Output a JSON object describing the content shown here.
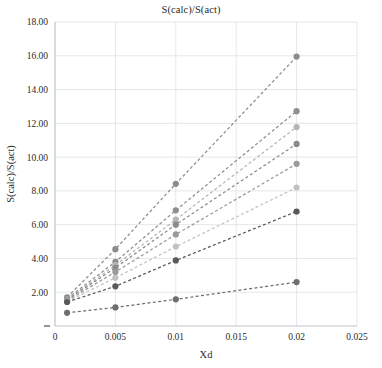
{
  "chart_data": {
    "type": "line",
    "title": "S(calc)/S(act)",
    "xlabel": "Xd",
    "ylabel": "S(calc)/S(act)",
    "xlim": [
      0,
      0.025
    ],
    "ylim": [
      0,
      18
    ],
    "xticks": [
      "0",
      "0.005",
      "0.01",
      "0.015",
      "0.02",
      "0.025"
    ],
    "xtick_values": [
      0,
      0.005,
      0.01,
      0.015,
      0.02,
      0.025
    ],
    "yticks": [
      "2.00",
      "4.00",
      "6.00",
      "8.00",
      "10.00",
      "12.00",
      "14.00",
      "16.00",
      "18.00"
    ],
    "ytick_values": [
      2,
      4,
      6,
      8,
      10,
      12,
      14,
      16,
      18
    ],
    "grid": true,
    "legend": "none",
    "x": [
      0.001,
      0.005,
      0.01,
      0.02
    ],
    "series": [
      {
        "name": "series-1",
        "color": "#8c8c8c",
        "values": [
          1.7,
          4.55,
          8.42,
          15.95
        ]
      },
      {
        "name": "series-2",
        "color": "#8f8f8f",
        "values": [
          1.62,
          3.8,
          6.85,
          12.72
        ]
      },
      {
        "name": "series-3",
        "color": "#b5b5b5",
        "values": [
          1.58,
          3.6,
          6.3,
          11.78
        ]
      },
      {
        "name": "series-4",
        "color": "#8a8a8a",
        "values": [
          1.55,
          3.45,
          6.0,
          10.78
        ]
      },
      {
        "name": "series-5",
        "color": "#9a9a9a",
        "values": [
          1.5,
          3.2,
          5.42,
          9.6
        ]
      },
      {
        "name": "series-6",
        "color": "#c2c2c2",
        "values": [
          1.45,
          2.85,
          4.7,
          8.2
        ]
      },
      {
        "name": "series-7",
        "color": "#595959",
        "values": [
          1.42,
          2.35,
          3.88,
          6.78
        ]
      },
      {
        "name": "series-8",
        "color": "#6e6e6e",
        "values": [
          0.78,
          1.1,
          1.58,
          2.6
        ]
      }
    ]
  }
}
